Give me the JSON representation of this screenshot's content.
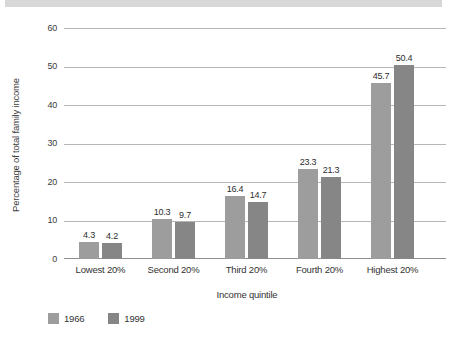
{
  "chart_data": {
    "type": "bar",
    "title": "",
    "categories": [
      "Lowest 20%",
      "Second 20%",
      "Third 20%",
      "Fourth 20%",
      "Highest 20%"
    ],
    "series": [
      {
        "name": "1966",
        "color": "#9d9d9d",
        "values": [
          4.3,
          10.3,
          16.4,
          23.3,
          45.7
        ]
      },
      {
        "name": "1999",
        "color": "#868686",
        "values": [
          4.2,
          9.7,
          14.7,
          21.3,
          50.4
        ]
      }
    ],
    "xlabel": "Income quintile",
    "ylabel": "Percentage of total family income",
    "ylim": [
      0,
      60
    ],
    "ytick_step": 10,
    "yticks": [
      "0",
      "10",
      "20",
      "30",
      "40",
      "50",
      "60"
    ],
    "grid": true,
    "value_labels": true,
    "legend_position": "bottom-left"
  },
  "palette": {
    "gridline": "#b6b6b6",
    "baseline": "#8f8f8f",
    "text": "#333333",
    "top_strip": "#d8d8d8"
  }
}
